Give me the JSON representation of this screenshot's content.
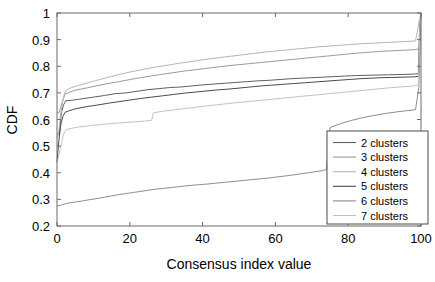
{
  "chart_data": {
    "type": "line",
    "title": "",
    "xlabel": "Consensus index value",
    "ylabel": "CDF",
    "xlim": [
      0,
      100
    ],
    "ylim": [
      0.2,
      1.0
    ],
    "xticks": [
      0,
      20,
      40,
      60,
      80,
      100
    ],
    "xticklabels": [
      "0",
      "20",
      "40",
      "60",
      "80",
      "100"
    ],
    "yticks": [
      0.2,
      0.3,
      0.4,
      0.5,
      0.6,
      0.7,
      0.8,
      0.9,
      1.0
    ],
    "yticklabels": [
      "0.2",
      "0.3",
      "0.4",
      "0.5",
      "0.6",
      "0.7",
      "0.8",
      "0.9",
      "1"
    ],
    "grid": false,
    "legend_position": "lower right",
    "series": [
      {
        "name": "2 clusters",
        "color": "#5f5f5f",
        "x": [
          0,
          0.6,
          1.2,
          1.8,
          2.4,
          4,
          7,
          10,
          13,
          16,
          19,
          22,
          25,
          28,
          31,
          34,
          37,
          40,
          43,
          46,
          49,
          52,
          55,
          58,
          61,
          64,
          67,
          70,
          73,
          76,
          79,
          82,
          85,
          88,
          91,
          94,
          97,
          99.4,
          99.6,
          100
        ],
        "y": [
          0.545,
          0.545,
          0.625,
          0.655,
          0.67,
          0.672,
          0.678,
          0.684,
          0.69,
          0.697,
          0.7,
          0.706,
          0.712,
          0.716,
          0.72,
          0.722,
          0.726,
          0.73,
          0.733,
          0.736,
          0.739,
          0.742,
          0.745,
          0.747,
          0.75,
          0.753,
          0.755,
          0.757,
          0.759,
          0.761,
          0.763,
          0.765,
          0.766,
          0.767,
          0.768,
          0.769,
          0.77,
          0.772,
          0.93,
          1.0
        ]
      },
      {
        "name": "3 clusters",
        "color": "#9a9a9a",
        "x": [
          0,
          0.5,
          1.0,
          1.6,
          2.2,
          3,
          5,
          8,
          11,
          14,
          17,
          20,
          23,
          26,
          29,
          32,
          35,
          38,
          41,
          44,
          47,
          50,
          53,
          56,
          59,
          62,
          65,
          68,
          71,
          74,
          77,
          80,
          83,
          86,
          89,
          92,
          95,
          98,
          99.4,
          99.7,
          100
        ],
        "y": [
          0.625,
          0.625,
          0.645,
          0.672,
          0.695,
          0.7,
          0.71,
          0.718,
          0.727,
          0.735,
          0.742,
          0.75,
          0.757,
          0.764,
          0.77,
          0.776,
          0.782,
          0.787,
          0.792,
          0.797,
          0.802,
          0.806,
          0.81,
          0.814,
          0.818,
          0.822,
          0.826,
          0.83,
          0.834,
          0.838,
          0.842,
          0.846,
          0.85,
          0.853,
          0.856,
          0.858,
          0.86,
          0.862,
          0.865,
          0.96,
          1.0
        ]
      },
      {
        "name": "4 clusters",
        "color": "#b5b5b5",
        "x": [
          0,
          0.5,
          1.0,
          1.5,
          2.0,
          2.6,
          4,
          6,
          9,
          12,
          15,
          18,
          21,
          24,
          27,
          30,
          33,
          36,
          39,
          42,
          45,
          48,
          51,
          54,
          57,
          60,
          63,
          66,
          69,
          72,
          75,
          78,
          81,
          84,
          87,
          90,
          93,
          96,
          98.5,
          99.5,
          100
        ],
        "y": [
          0.53,
          0.555,
          0.62,
          0.665,
          0.695,
          0.71,
          0.72,
          0.728,
          0.74,
          0.751,
          0.762,
          0.772,
          0.781,
          0.789,
          0.797,
          0.803,
          0.81,
          0.816,
          0.822,
          0.828,
          0.833,
          0.838,
          0.843,
          0.848,
          0.853,
          0.857,
          0.861,
          0.865,
          0.869,
          0.873,
          0.876,
          0.879,
          0.882,
          0.885,
          0.887,
          0.889,
          0.891,
          0.893,
          0.895,
          0.97,
          1.0
        ]
      },
      {
        "name": "5 clusters",
        "color": "#4a4a4a",
        "x": [
          0,
          0.5,
          1.1,
          1.7,
          2.3,
          3.2,
          5,
          8,
          11,
          14,
          17,
          20,
          23,
          26,
          29,
          32,
          35,
          38,
          41,
          44,
          47,
          50,
          53,
          56,
          59,
          62,
          65,
          68,
          71,
          74,
          77,
          80,
          83,
          86,
          89,
          92,
          95,
          98,
          99.3,
          99.7,
          100
        ],
        "y": [
          0.44,
          0.52,
          0.585,
          0.615,
          0.628,
          0.632,
          0.64,
          0.648,
          0.654,
          0.661,
          0.667,
          0.673,
          0.679,
          0.684,
          0.689,
          0.694,
          0.699,
          0.703,
          0.707,
          0.711,
          0.714,
          0.718,
          0.722,
          0.726,
          0.729,
          0.732,
          0.735,
          0.738,
          0.741,
          0.744,
          0.747,
          0.75,
          0.753,
          0.755,
          0.757,
          0.758,
          0.759,
          0.76,
          0.762,
          0.94,
          1.0
        ]
      },
      {
        "name": "6 clusters",
        "color": "#8d8d8d",
        "x": [
          0,
          1,
          2,
          3,
          5,
          7,
          9,
          11,
          13,
          15,
          17,
          19,
          21,
          23,
          25,
          27,
          29,
          31,
          33,
          35,
          37,
          40,
          43,
          46,
          49,
          52,
          55,
          58,
          61,
          64,
          67,
          70,
          73,
          74,
          75,
          78,
          81,
          84,
          87,
          90,
          93,
          96,
          98.5,
          99.4,
          100
        ],
        "y": [
          0.275,
          0.278,
          0.282,
          0.286,
          0.29,
          0.294,
          0.299,
          0.303,
          0.308,
          0.313,
          0.318,
          0.322,
          0.326,
          0.33,
          0.334,
          0.338,
          0.341,
          0.344,
          0.347,
          0.35,
          0.353,
          0.356,
          0.36,
          0.364,
          0.368,
          0.372,
          0.376,
          0.38,
          0.385,
          0.39,
          0.396,
          0.402,
          0.408,
          0.412,
          0.57,
          0.585,
          0.597,
          0.607,
          0.615,
          0.622,
          0.628,
          0.633,
          0.637,
          0.72,
          1.0
        ]
      },
      {
        "name": "7 clusters",
        "color": "#c2c2c2",
        "x": [
          0,
          0.6,
          1.2,
          1.8,
          2.5,
          4,
          6,
          9,
          12,
          15,
          18,
          21,
          24,
          26,
          26.5,
          29,
          32,
          35,
          38,
          41,
          44,
          47,
          50,
          53,
          56,
          59,
          62,
          65,
          68,
          71,
          74,
          77,
          80,
          83,
          86,
          89,
          92,
          95,
          98,
          99.3,
          99.7,
          100
        ],
        "y": [
          0.44,
          0.47,
          0.51,
          0.545,
          0.562,
          0.567,
          0.572,
          0.577,
          0.581,
          0.585,
          0.588,
          0.591,
          0.594,
          0.597,
          0.625,
          0.631,
          0.636,
          0.641,
          0.646,
          0.651,
          0.655,
          0.66,
          0.664,
          0.668,
          0.672,
          0.676,
          0.68,
          0.684,
          0.688,
          0.692,
          0.696,
          0.7,
          0.704,
          0.708,
          0.712,
          0.716,
          0.72,
          0.723,
          0.726,
          0.73,
          0.95,
          1.0
        ]
      }
    ]
  },
  "legend": {
    "entries": [
      {
        "label": "2 clusters",
        "color": "#5f5f5f"
      },
      {
        "label": "3 clusters",
        "color": "#9a9a9a"
      },
      {
        "label": "4 clusters",
        "color": "#b5b5b5"
      },
      {
        "label": "5 clusters",
        "color": "#4a4a4a"
      },
      {
        "label": "6 clusters",
        "color": "#8d8d8d"
      },
      {
        "label": "7 clusters",
        "color": "#c2c2c2"
      }
    ]
  },
  "axes": {
    "frame_color": "#6b6b6b"
  }
}
